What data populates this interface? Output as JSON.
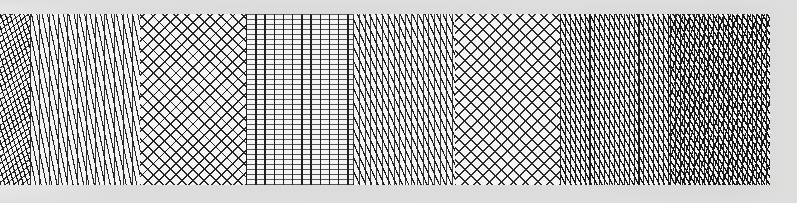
{
  "canvas": {
    "width": 797,
    "height": 203,
    "background_color": "#dcdcdc",
    "description": "Horizontal strip of eight adjacent hatch pattern swatches"
  },
  "band": {
    "x": 0,
    "y": 14,
    "width": 770,
    "height": 171,
    "paper_color": "#f4f4f4"
  },
  "swatches": [
    {
      "index": 1,
      "name": "dense-crosshatch",
      "label": "Dense Crosshatch",
      "x": 0,
      "width": 30,
      "angles_deg": [
        72,
        -38
      ],
      "line_spacing_px": [
        4.4,
        5.0
      ],
      "line_color": "#1a1a1a",
      "density": "very-high"
    },
    {
      "index": 2,
      "name": "steep-diagonal-rules",
      "label": "Steep Diagonal With Vertical Rules",
      "x": 30,
      "width": 110,
      "angles_deg": [
        78,
        90
      ],
      "line_spacing_px": [
        5.2,
        9.3
      ],
      "line_color": "#222222",
      "density": "medium"
    },
    {
      "index": 3,
      "name": "diamond-lattice",
      "label": "Diamond Lattice",
      "x": 140,
      "width": 106,
      "angles_deg": [
        45,
        -45
      ],
      "line_spacing_px": [
        8.0,
        8.0
      ],
      "line_color": "#242424",
      "density": "medium"
    },
    {
      "index": 4,
      "name": "orthogonal-grid",
      "label": "Orthogonal Grid",
      "x": 246,
      "width": 107,
      "angles_deg": [
        90,
        0
      ],
      "line_spacing_px": [
        9.2,
        5.0
      ],
      "line_color": "#1f1f1f",
      "density": "medium"
    },
    {
      "index": 5,
      "name": "fine-steep-hatch",
      "label": "Fine Steep Hatch",
      "x": 353,
      "width": 102,
      "angles_deg": [
        66,
        90
      ],
      "line_spacing_px": [
        5.6,
        5.8
      ],
      "line_color": "#1d1d1d",
      "density": "high"
    },
    {
      "index": 6,
      "name": "open-crosshatch",
      "label": "Open Crosshatch",
      "x": 455,
      "width": 105,
      "angles_deg": [
        45,
        -45
      ],
      "line_spacing_px": [
        8.6,
        8.6
      ],
      "line_color": "#2a2a2a",
      "density": "medium-low"
    },
    {
      "index": 7,
      "name": "dense-steep-grid",
      "label": "Dense Steep Grid",
      "x": 560,
      "width": 110,
      "angles_deg": [
        62,
        90
      ],
      "line_spacing_px": [
        4.6,
        4.9
      ],
      "line_color": "#181818",
      "density": "high"
    },
    {
      "index": 8,
      "name": "dark-mesh",
      "label": "Dark Woven Mesh",
      "x": 670,
      "width": 100,
      "angles_deg": [
        58,
        -72,
        90
      ],
      "line_spacing_px": [
        4.2,
        6.4,
        4.8
      ],
      "line_color": "#141414",
      "density": "very-high"
    }
  ],
  "chart_data": {
    "type": "heatmap",
    "title": "",
    "xlabel": "",
    "ylabel": "",
    "categories": [
      "dense-crosshatch",
      "steep-diagonal-rules",
      "diamond-lattice",
      "orthogonal-grid",
      "fine-steep-hatch",
      "open-crosshatch",
      "dense-steep-grid",
      "dark-mesh"
    ],
    "values": [
      30,
      110,
      106,
      107,
      102,
      105,
      110,
      100
    ],
    "series": [
      {
        "name": "swatch_width_px",
        "values": [
          30,
          110,
          106,
          107,
          102,
          105,
          110,
          100
        ]
      },
      {
        "name": "primary_angle_deg",
        "values": [
          72,
          78,
          45,
          90,
          66,
          45,
          62,
          58
        ]
      },
      {
        "name": "primary_spacing_px",
        "values": [
          4.4,
          5.2,
          8.0,
          9.2,
          5.6,
          8.6,
          4.6,
          4.2
        ]
      }
    ],
    "xlim": [
      0,
      770
    ],
    "ylim": [
      14,
      185
    ],
    "grid": false,
    "legend": "none"
  }
}
